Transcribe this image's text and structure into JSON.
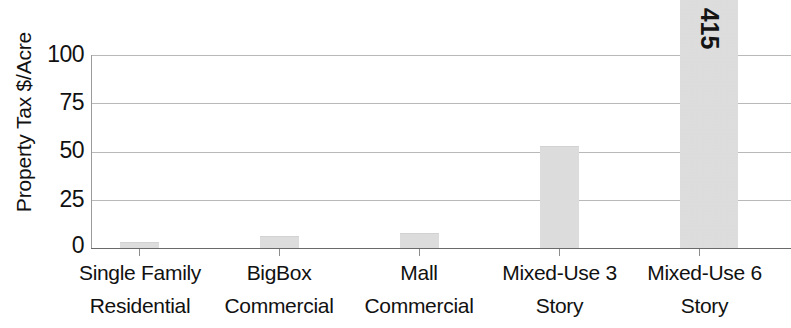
{
  "chart_data": {
    "type": "bar",
    "title": "",
    "subtitle": "",
    "xlabel": "",
    "ylabel": "Property Tax $/Acre",
    "categories": [
      "Single Family Residential",
      "BigBox Commercial",
      "Mall Commercial",
      "Mixed-Use 3 Story",
      "Mixed-Use 6 Story"
    ],
    "category_lines": [
      [
        "Single Family",
        "Residential"
      ],
      [
        "BigBox",
        "Commercial"
      ],
      [
        "Mall",
        "Commercial"
      ],
      [
        "Mixed-Use 3",
        "Story"
      ],
      [
        "Mixed-Use 6",
        "Story"
      ]
    ],
    "values": [
      3,
      6,
      8,
      53,
      415
    ],
    "value_labels": [
      "",
      "",
      "",
      "",
      "415"
    ],
    "ylim": [
      0,
      100
    ],
    "y_ticks": [
      0,
      25,
      50,
      75,
      100
    ],
    "y_tick_labels": [
      "0",
      "25",
      "50",
      "75",
      "100"
    ],
    "grid": true,
    "grid_axis": "y",
    "legend": "none",
    "bar_color": "#e4e4e4",
    "grid_color": "#b9b9b9",
    "axis_color": "#6a6a6a",
    "text_color": "#111111"
  },
  "axis": {
    "y_label": "Property Tax $/Acre",
    "ticks": [
      {
        "label": "100",
        "value": 100
      },
      {
        "label": "75",
        "value": 75
      },
      {
        "label": "50",
        "value": 50
      },
      {
        "label": "25",
        "value": 25
      },
      {
        "label": "0",
        "value": 0
      }
    ]
  },
  "bars": [
    {
      "name": "single-family-residential",
      "line1": "Single Family",
      "line2": "Residential",
      "value": 3,
      "value_label": ""
    },
    {
      "name": "bigbox-commercial",
      "line1": "BigBox",
      "line2": "Commercial",
      "value": 6,
      "value_label": ""
    },
    {
      "name": "mall-commercial",
      "line1": "Mall",
      "line2": "Commercial",
      "value": 8,
      "value_label": ""
    },
    {
      "name": "mixed-use-3-story",
      "line1": "Mixed-Use 3",
      "line2": "Story",
      "value": 53,
      "value_label": ""
    },
    {
      "name": "mixed-use-6-story",
      "line1": "Mixed-Use 6",
      "line2": "Story",
      "value": 415,
      "value_label": "415"
    }
  ]
}
